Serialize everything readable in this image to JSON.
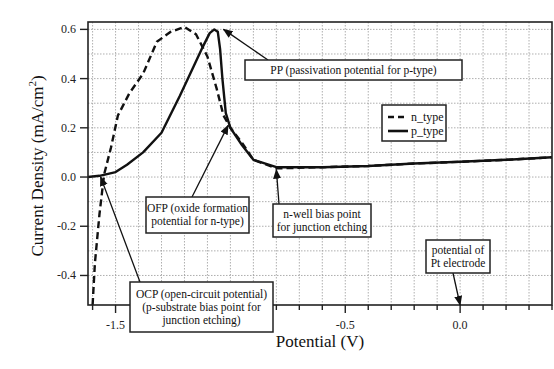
{
  "chart_data": {
    "type": "line",
    "title": "",
    "xlabel": "Potential (V)",
    "ylabel": "Current Density (mA/cm2)",
    "ylabel_parts": {
      "main": "Current Density (mA/cm",
      "sup": "2",
      "end": ")"
    },
    "xlim": [
      -1.62,
      0.4
    ],
    "ylim": [
      -0.52,
      0.63
    ],
    "grid": true,
    "x_ticks": [
      {
        "value": -1.5,
        "label": "-1.5"
      },
      {
        "value": -1.0,
        "label": "-1.0"
      },
      {
        "value": -0.5,
        "label": "-0.5"
      },
      {
        "value": 0.0,
        "label": "0.0"
      }
    ],
    "y_ticks": [
      {
        "value": 0.6,
        "label": "0.6"
      },
      {
        "value": 0.4,
        "label": "0.4"
      },
      {
        "value": 0.2,
        "label": "0.2"
      },
      {
        "value": 0.0,
        "label": "0.0"
      },
      {
        "value": -0.2,
        "label": "-0.2"
      },
      {
        "value": -0.4,
        "label": "-0.4"
      }
    ],
    "legend": {
      "position": "right-middle",
      "entries": [
        {
          "name": "n_type",
          "style": "dashed"
        },
        {
          "name": "p_type",
          "style": "solid"
        }
      ]
    },
    "series": [
      {
        "name": "n_type",
        "style": "dashed",
        "x": [
          -1.6,
          -1.59,
          -1.57,
          -1.55,
          -1.52,
          -1.49,
          -1.44,
          -1.38,
          -1.32,
          -1.26,
          -1.2,
          -1.15,
          -1.1,
          -1.06,
          -1.03,
          -1.0,
          -0.95,
          -0.9,
          -0.8,
          -0.6,
          -0.4,
          -0.2,
          0.0,
          0.2,
          0.4
        ],
        "y": [
          -0.52,
          -0.35,
          -0.15,
          0.01,
          0.12,
          0.25,
          0.34,
          0.42,
          0.55,
          0.59,
          0.61,
          0.58,
          0.49,
          0.36,
          0.25,
          0.2,
          0.14,
          0.07,
          0.035,
          0.04,
          0.045,
          0.055,
          0.062,
          0.07,
          0.08
        ]
      },
      {
        "name": "p_type",
        "style": "solid",
        "x": [
          -1.62,
          -1.57,
          -1.5,
          -1.45,
          -1.38,
          -1.3,
          -1.22,
          -1.16,
          -1.12,
          -1.09,
          -1.07,
          -1.055,
          -1.045,
          -1.035,
          -1.02,
          -1.0,
          -0.95,
          -0.9,
          -0.8,
          -0.6,
          -0.4,
          -0.2,
          0.0,
          0.2,
          0.4
        ],
        "y": [
          0.0,
          0.005,
          0.02,
          0.05,
          0.1,
          0.18,
          0.33,
          0.45,
          0.53,
          0.585,
          0.6,
          0.59,
          0.52,
          0.4,
          0.26,
          0.2,
          0.13,
          0.07,
          0.04,
          0.04,
          0.045,
          0.055,
          0.062,
          0.07,
          0.08
        ]
      }
    ],
    "annotations": [
      {
        "id": "pp",
        "lines": [
          "PP (passivation potential for p-type)"
        ],
        "points_to": {
          "x": -1.03,
          "y": 0.6
        }
      },
      {
        "id": "ofp",
        "lines": [
          "OFP (oxide formation",
          "potential for n-type)"
        ],
        "points_to": {
          "x": -1.01,
          "y": 0.21
        }
      },
      {
        "id": "ocp",
        "lines": [
          "OCP (open-circuit potential)",
          "(p-substrate bias point for",
          "junction etching)"
        ],
        "points_to": {
          "x": -1.565,
          "y": 0.0
        }
      },
      {
        "id": "nwell",
        "lines": [
          "n-well bias point",
          "for junction etching"
        ],
        "points_to": {
          "x": -0.8,
          "y": 0.03
        }
      },
      {
        "id": "pt",
        "lines": [
          "potential of",
          "Pt electrode"
        ],
        "points_to": {
          "x": 0.0,
          "y": -0.52
        }
      }
    ]
  },
  "colors": {
    "line": "#111111",
    "grid": "#9a9a9a",
    "frame": "#222222",
    "background": "#ffffff"
  }
}
